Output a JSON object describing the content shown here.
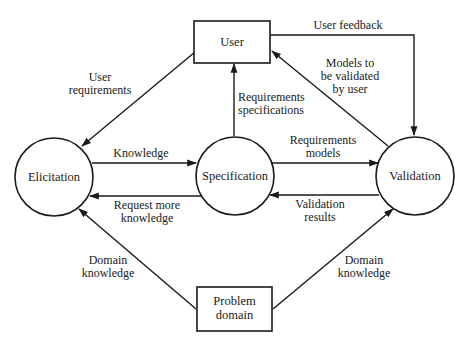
{
  "diagram": {
    "type": "data-flow",
    "nodes": {
      "user": {
        "label": "User",
        "shape": "rectangle"
      },
      "problem_domain": {
        "label_line1": "Problem",
        "label_line2": "domain",
        "shape": "rectangle"
      },
      "elicitation": {
        "label": "Elicitation",
        "shape": "circle"
      },
      "specification": {
        "label": "Specification",
        "shape": "circle"
      },
      "validation": {
        "label": "Validation",
        "shape": "circle"
      }
    },
    "edges": {
      "user_requirements": {
        "from": "User",
        "to": "Elicitation",
        "line1": "User",
        "line2": "requirements"
      },
      "knowledge": {
        "from": "Elicitation",
        "to": "Specification",
        "line1": "Knowledge"
      },
      "request_more_knowledge": {
        "from": "Specification",
        "to": "Elicitation",
        "line1": "Request more",
        "line2": "knowledge"
      },
      "requirements_specifications": {
        "from": "Specification",
        "to": "User",
        "line1": "Requirements",
        "line2": "specifications"
      },
      "requirements_models": {
        "from": "Specification",
        "to": "Validation",
        "line1": "Requirements",
        "line2": "models"
      },
      "validation_results": {
        "from": "Validation",
        "to": "Specification",
        "line1": "Validation",
        "line2": "results"
      },
      "user_feedback": {
        "from": "User",
        "to": "Validation",
        "line1": "User feedback"
      },
      "models_to_be_validated": {
        "from": "Validation",
        "to": "User",
        "line1": "Models to",
        "line2": "be validated",
        "line3": "by user"
      },
      "domain_knowledge_elicitation": {
        "from": "Problem domain",
        "to": "Elicitation",
        "line1": "Domain",
        "line2": "knowledge"
      },
      "domain_knowledge_validation": {
        "from": "Problem domain",
        "to": "Validation",
        "line1": "Domain",
        "line2": "knowledge"
      }
    }
  }
}
